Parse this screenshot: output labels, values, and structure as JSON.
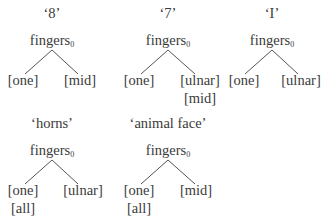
{
  "trees": [
    {
      "title": "‘8’",
      "root": "fingers",
      "sub": "0",
      "left": [
        "[one]"
      ],
      "right": [
        "[mid]"
      ]
    },
    {
      "title": "‘7’",
      "root": "fingers",
      "sub": "0",
      "left": [
        "[one]"
      ],
      "right": [
        "[ulnar]",
        "[mid]"
      ]
    },
    {
      "title": "‘I’",
      "root": "fingers",
      "sub": "0",
      "left": [
        "[one]"
      ],
      "right": [
        "[ulnar]"
      ]
    },
    {
      "title": "‘horns’",
      "root": "fingers",
      "sub": "0",
      "left": [
        "[one]",
        "[all]"
      ],
      "right": [
        "[ulnar]"
      ]
    },
    {
      "title": "‘animal face’",
      "root": "fingers",
      "sub": "0",
      "left": [
        "[one]",
        "[all]"
      ],
      "right": [
        "[mid]"
      ]
    }
  ]
}
